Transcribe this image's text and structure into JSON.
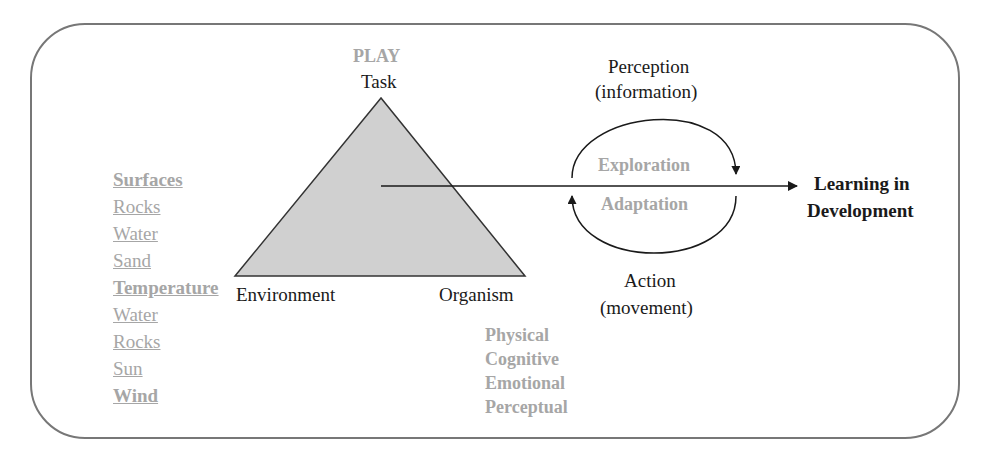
{
  "diagram": {
    "triangle": {
      "top_heading": "PLAY",
      "top_label": "Task",
      "bottom_left_label": "Environment",
      "bottom_right_label": "Organism"
    },
    "environment_factors": [
      {
        "label": "Surfaces",
        "type": "heading"
      },
      {
        "label": "Rocks",
        "type": "item"
      },
      {
        "label": "Water",
        "type": "item"
      },
      {
        "label": "Sand",
        "type": "item"
      },
      {
        "label": "Temperature",
        "type": "heading"
      },
      {
        "label": "Water",
        "type": "item"
      },
      {
        "label": "Rocks",
        "type": "item"
      },
      {
        "label": "Sun",
        "type": "item"
      },
      {
        "label": "Wind",
        "type": "heading"
      }
    ],
    "organism_factors": [
      "Physical",
      "Cognitive",
      "Emotional",
      "Perceptual"
    ],
    "cycle": {
      "top_label_line1": "Perception",
      "top_label_line2": "(information)",
      "upper_inner": "Exploration",
      "lower_inner": "Adaptation",
      "bottom_label_line1": "Action",
      "bottom_label_line2": "(movement)"
    },
    "outcome": {
      "line1": "Learning in",
      "line2": "Development"
    },
    "colors": {
      "border": "#777777",
      "triangle_fill": "#d0d0d0",
      "grey_text": "#a6a6a6",
      "black_text": "#1a1a1a"
    }
  }
}
